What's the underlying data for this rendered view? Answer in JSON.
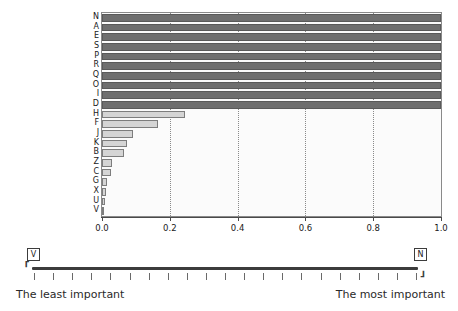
{
  "chart_data": {
    "type": "bar",
    "orientation": "horizontal",
    "title": "",
    "xlabel": "",
    "ylabel": "",
    "xlim": [
      0.0,
      1.0
    ],
    "grid": "vertical-dotted",
    "legend": "none",
    "categories": [
      "N",
      "A",
      "E",
      "S",
      "P",
      "R",
      "Q",
      "O",
      "I",
      "D",
      "H",
      "F",
      "J",
      "K",
      "B",
      "Z",
      "C",
      "G",
      "X",
      "U",
      "V"
    ],
    "values": [
      1.0,
      1.0,
      1.0,
      1.0,
      1.0,
      1.0,
      1.0,
      1.0,
      1.0,
      1.0,
      0.245,
      0.165,
      0.09,
      0.075,
      0.065,
      0.03,
      0.028,
      0.016,
      0.012,
      0.008,
      0.004
    ],
    "tick_labels": [
      "0.0",
      "0.2",
      "0.4",
      "0.6",
      "0.8",
      "1.0"
    ],
    "tick_values": [
      0.0,
      0.2,
      0.4,
      0.6,
      0.8,
      1.0
    ],
    "gridline_values": [
      0.2,
      0.4,
      0.6,
      0.8
    ],
    "bar_colors": {
      "saturated": "#6f6f6f",
      "unsaturated": "#d5d5d5",
      "edge_dark": "#5a5a5a",
      "edge_light": "#7d7d7d"
    },
    "saturated_count": 10
  },
  "slider": {
    "left_handle_label": "V",
    "right_handle_label": "N",
    "left_end_label": "The least important",
    "right_end_label": "The most important",
    "left_cap": "⸢",
    "right_cap": "⸥",
    "tick_count": 21
  }
}
